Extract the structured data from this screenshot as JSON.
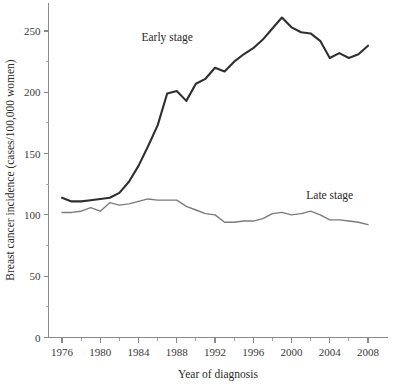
{
  "chart_data": {
    "type": "line",
    "title": "",
    "xlabel": "Year of diagnosis",
    "ylabel": "Breast cancer incidence (cases/100,000 women)",
    "xlim": [
      1975,
      2009
    ],
    "ylim": [
      0,
      270
    ],
    "grid": false,
    "legend_position": "inline-annotations",
    "x_ticks": [
      1976,
      1980,
      1984,
      1988,
      1992,
      1996,
      2000,
      2004,
      2008
    ],
    "x_tick_labels": [
      "1976",
      "1980",
      "1984",
      "1988",
      "1992",
      "1996",
      "2000",
      "2004",
      "2008"
    ],
    "x_minor_tick_interval": 2,
    "y_ticks": [
      0,
      50,
      100,
      150,
      200,
      250
    ],
    "y_tick_labels": [
      "0",
      "50",
      "100",
      "150",
      "200",
      "250"
    ],
    "y_minor_ticks": [
      25,
      75,
      125,
      175,
      225
    ],
    "x": [
      1976,
      1977,
      1978,
      1979,
      1980,
      1981,
      1982,
      1983,
      1984,
      1985,
      1986,
      1987,
      1988,
      1989,
      1990,
      1991,
      1992,
      1993,
      1994,
      1995,
      1996,
      1997,
      1998,
      1999,
      2000,
      2001,
      2002,
      2003,
      2004,
      2005,
      2006,
      2007,
      2008
    ],
    "series": [
      {
        "name": "Early stage",
        "color": "#2f2f2f",
        "annotation": "Early stage",
        "annotation_x": 1987,
        "annotation_y": 242,
        "values": [
          114,
          111,
          111,
          112,
          113,
          114,
          118,
          127,
          140,
          156,
          173,
          199,
          201,
          193,
          207,
          211,
          220,
          217,
          225,
          231,
          236,
          243,
          252,
          261,
          253,
          249,
          248,
          242,
          228,
          232,
          228,
          231,
          238
        ]
      },
      {
        "name": "Late stage",
        "color": "#7b7b7b",
        "annotation": "Late stage",
        "annotation_x": 2004,
        "annotation_y": 113,
        "values": [
          102,
          102,
          103,
          106,
          103,
          110,
          108,
          109,
          111,
          113,
          112,
          112,
          112,
          107,
          104,
          101,
          100,
          94,
          94,
          95,
          95,
          97,
          101,
          102,
          100,
          101,
          103,
          100,
          96,
          96,
          95,
          94,
          92
        ]
      }
    ]
  },
  "annotations": {
    "early_stage_label": "Early stage",
    "late_stage_label": "Late stage"
  }
}
